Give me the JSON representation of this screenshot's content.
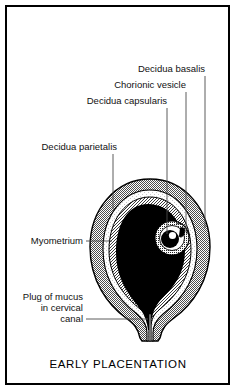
{
  "figure": {
    "title": "EARLY PLACENTATION",
    "border_color": "#000000",
    "background_color": "#ffffff"
  },
  "labels": [
    {
      "id": "decidua-basalis",
      "text": "Decidua basalis",
      "text_x": 205,
      "text_y": 72,
      "anchor": "end",
      "leader": "M 205 76 L 205 215"
    },
    {
      "id": "chorionic-vesicle",
      "text": "Chorionic vesicle",
      "text_x": 186,
      "text_y": 88,
      "anchor": "end",
      "leader": "M 186 92 L 186 226"
    },
    {
      "id": "decidua-capsularis",
      "text": "Decidua capsularis",
      "text_x": 167,
      "text_y": 104,
      "anchor": "end",
      "leader": "M 167 108 L 167 232"
    },
    {
      "id": "decidua-parietalis",
      "text": "Decidua parietalis",
      "text_x": 117,
      "text_y": 150,
      "anchor": "end",
      "leader": "M 113 154 L 113 206"
    },
    {
      "id": "myometrium",
      "text": "Myometrium",
      "text_x": 83,
      "text_y": 244,
      "anchor": "end",
      "leader": "M 86 241 L 112 241"
    },
    {
      "id": "plug-of-mucus",
      "text": "Plug of mucus",
      "text_lines": [
        "Plug of mucus",
        "in cervical",
        "canal"
      ],
      "text_x": 83,
      "text_y": 300,
      "anchor": "end",
      "leader": "M 86 319 L 149 319"
    }
  ],
  "label_lines": {
    "mucus_line_1": "Plug of mucus",
    "mucus_line_2": "in cervical",
    "mucus_line_3": "canal"
  },
  "anatomy": {
    "myometrium_fill": "#6e6e6e",
    "decidua_parietalis_fill": "#f2f2f2",
    "decidua_capsularis_fill": "#9a9a9a",
    "chorionic_cavity_fill": "#000000",
    "embryo_ring_fill": "#bdbdbd",
    "embryo_disc_fill": "#000000",
    "embryo_highlight_fill": "#ffffff",
    "outline_color": "#000000"
  }
}
